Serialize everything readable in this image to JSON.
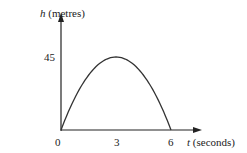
{
  "chart_data": {
    "type": "line",
    "title": "",
    "xlabel_var": "t",
    "xlabel_unit": "(seconds)",
    "ylabel_var": "h",
    "ylabel_unit": "(metres)",
    "x_ticks": [
      "0",
      "3",
      "6"
    ],
    "y_ticks": [
      "45"
    ],
    "xlim": [
      0,
      6.6
    ],
    "ylim": [
      0,
      60
    ],
    "grid": false,
    "series": [
      {
        "name": "h(t) = 30t - 5t^2",
        "x": [
          0,
          0.5,
          1,
          1.5,
          2,
          2.5,
          3,
          3.5,
          4,
          4.5,
          5,
          5.5,
          6
        ],
        "y": [
          0,
          13.75,
          25,
          33.75,
          40,
          43.75,
          45,
          43.75,
          40,
          33.75,
          25,
          13.75,
          0
        ]
      }
    ],
    "colors": {
      "axis": "#222222",
      "curve": "#333333"
    }
  }
}
